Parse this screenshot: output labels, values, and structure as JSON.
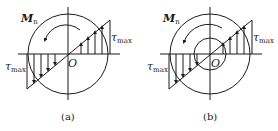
{
  "figures": [
    {
      "id": "a",
      "caption": "(a)",
      "moment_label": "M",
      "moment_sub": "n",
      "center_label": "O",
      "tau_left": "τ",
      "tau_right": "τ",
      "tau_sub": "max",
      "section": "solid circular"
    },
    {
      "id": "b",
      "caption": "(b)",
      "moment_label": "M",
      "moment_sub": "n",
      "center_label": "O",
      "tau_left": "τ",
      "tau_right": "τ",
      "tau_sub": "max",
      "section": "hollow circular"
    }
  ],
  "colors": {
    "stroke": "#1a1a1a",
    "background": "#ffffff"
  }
}
